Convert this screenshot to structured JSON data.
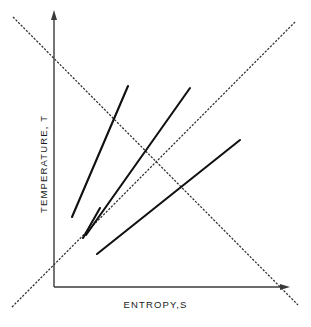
{
  "figure": {
    "name": "temperature-entropy-diagram",
    "background_color": "#ffffff"
  },
  "axes": {
    "x": {
      "label": "ENTROPY,S",
      "origin": [
        54,
        287
      ],
      "end": [
        288,
        287
      ],
      "arrow": true,
      "color": "#3a3a3a"
    },
    "y": {
      "label": "TEMPERATURE, T",
      "origin": [
        54,
        287
      ],
      "end": [
        54,
        13
      ],
      "arrow": true,
      "color": "#3a3a3a"
    }
  },
  "chart_data": {
    "type": "line",
    "title": "",
    "xlabel": "ENTROPY,S",
    "ylabel": "TEMPERATURE, T",
    "grid": false,
    "legend": null,
    "axis_ranges": {
      "x": [
        54,
        288
      ],
      "y": [
        287,
        13
      ]
    },
    "series": [
      {
        "name": "steep-process-line-1",
        "style": "solid",
        "color": "#111111",
        "x": [
          72,
          128
        ],
        "y": [
          217,
          86
        ]
      },
      {
        "name": "steep-process-line-2",
        "style": "solid",
        "color": "#111111",
        "x": [
          86,
          190
        ],
        "y": [
          235,
          88
        ]
      },
      {
        "name": "steep-process-line-3",
        "style": "solid",
        "color": "#111111",
        "x": [
          83,
          100
        ],
        "y": [
          238,
          208
        ]
      },
      {
        "name": "shallow-process-line",
        "style": "solid",
        "color": "#111111",
        "x": [
          97,
          240
        ],
        "y": [
          254,
          140
        ]
      },
      {
        "name": "ascending-dashed-guide",
        "style": "dashed",
        "color": "#2e2e2e",
        "x": [
          12,
          295
        ],
        "y": [
          307,
          22
        ]
      },
      {
        "name": "descending-dashed-guide",
        "style": "dashed",
        "color": "#2e2e2e",
        "x": [
          13,
          298
        ],
        "y": [
          17,
          305
        ]
      }
    ]
  }
}
